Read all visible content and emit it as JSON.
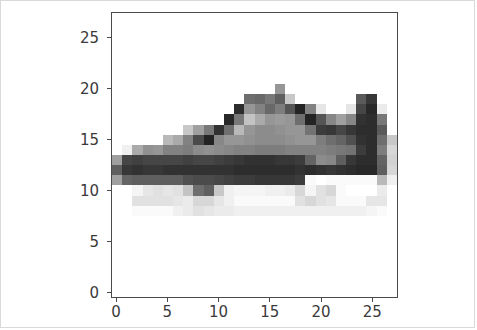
{
  "figure": {
    "background_color": "#ffffff",
    "border_color": "#d9d9d9",
    "axes_edge_color": "#4a4a4a",
    "tick_label_color": "#3a3a3a"
  },
  "chart_data": {
    "type": "heatmap",
    "title": "",
    "xlabel": "",
    "ylabel": "",
    "colormap": "gray",
    "origin": "upper",
    "grid": false,
    "legend": null,
    "colorbar": false,
    "vmin": 0,
    "vmax": 255,
    "shape": [
      28,
      28
    ],
    "xlim": [
      -0.5,
      27.5
    ],
    "ylim": [
      27.5,
      -0.5
    ],
    "xticks": [
      0,
      5,
      10,
      15,
      20,
      25
    ],
    "xticklabels": [
      "0",
      "5",
      "10",
      "15",
      "20",
      "25"
    ],
    "yticks": [
      0,
      5,
      10,
      15,
      20,
      25
    ],
    "yticklabels": [
      "0",
      "5",
      "10",
      "15",
      "20",
      "25"
    ],
    "values": [
      [
        255,
        255,
        255,
        255,
        255,
        255,
        255,
        255,
        255,
        255,
        255,
        255,
        255,
        255,
        255,
        255,
        255,
        255,
        255,
        255,
        255,
        255,
        255,
        255,
        255,
        255,
        255,
        255
      ],
      [
        255,
        255,
        255,
        255,
        255,
        255,
        255,
        255,
        255,
        255,
        255,
        255,
        255,
        255,
        255,
        255,
        255,
        255,
        255,
        255,
        255,
        255,
        255,
        255,
        255,
        255,
        255,
        255
      ],
      [
        255,
        255,
        255,
        255,
        255,
        255,
        255,
        255,
        255,
        255,
        255,
        255,
        255,
        255,
        255,
        255,
        255,
        255,
        255,
        255,
        255,
        255,
        255,
        255,
        255,
        255,
        255,
        255
      ],
      [
        255,
        255,
        255,
        255,
        255,
        255,
        255,
        255,
        255,
        255,
        255,
        255,
        255,
        255,
        255,
        255,
        255,
        255,
        255,
        255,
        255,
        255,
        255,
        255,
        255,
        255,
        255,
        255
      ],
      [
        255,
        255,
        255,
        255,
        255,
        255,
        255,
        255,
        255,
        255,
        255,
        255,
        255,
        255,
        255,
        255,
        255,
        255,
        255,
        255,
        255,
        255,
        255,
        255,
        255,
        255,
        255,
        255
      ],
      [
        255,
        255,
        255,
        255,
        255,
        255,
        255,
        255,
        255,
        255,
        255,
        255,
        255,
        255,
        255,
        255,
        255,
        255,
        255,
        255,
        255,
        255,
        255,
        255,
        255,
        255,
        255,
        255
      ],
      [
        255,
        255,
        255,
        255,
        255,
        255,
        255,
        255,
        255,
        255,
        255,
        255,
        255,
        255,
        255,
        255,
        255,
        255,
        255,
        255,
        255,
        255,
        255,
        255,
        255,
        255,
        255,
        255
      ],
      [
        255,
        255,
        255,
        255,
        255,
        255,
        255,
        255,
        255,
        255,
        255,
        255,
        255,
        255,
        255,
        255,
        150,
        255,
        255,
        255,
        255,
        255,
        255,
        255,
        255,
        255,
        255,
        255
      ],
      [
        255,
        255,
        255,
        255,
        255,
        255,
        255,
        255,
        255,
        255,
        255,
        255,
        255,
        110,
        105,
        120,
        95,
        200,
        255,
        255,
        255,
        255,
        255,
        255,
        90,
        55,
        255,
        255
      ],
      [
        255,
        255,
        255,
        255,
        255,
        255,
        255,
        255,
        255,
        255,
        255,
        255,
        45,
        150,
        130,
        105,
        125,
        85,
        35,
        130,
        230,
        255,
        255,
        230,
        70,
        40,
        235,
        255
      ],
      [
        255,
        255,
        255,
        255,
        255,
        255,
        255,
        255,
        255,
        255,
        255,
        40,
        120,
        195,
        170,
        150,
        155,
        150,
        110,
        35,
        85,
        135,
        160,
        135,
        50,
        45,
        120,
        255
      ],
      [
        255,
        255,
        255,
        255,
        255,
        255,
        255,
        200,
        160,
        120,
        50,
        110,
        185,
        150,
        140,
        140,
        145,
        150,
        150,
        115,
        60,
        55,
        70,
        55,
        45,
        45,
        90,
        255
      ],
      [
        255,
        255,
        255,
        255,
        255,
        185,
        170,
        130,
        75,
        35,
        135,
        150,
        150,
        145,
        140,
        140,
        140,
        145,
        150,
        150,
        125,
        110,
        100,
        80,
        50,
        45,
        110,
        200
      ],
      [
        255,
        240,
        170,
        145,
        150,
        130,
        130,
        125,
        140,
        145,
        140,
        135,
        130,
        130,
        125,
        125,
        125,
        130,
        130,
        130,
        130,
        125,
        120,
        115,
        60,
        45,
        125,
        215
      ],
      [
        160,
        70,
        65,
        70,
        70,
        70,
        70,
        65,
        70,
        70,
        65,
        60,
        55,
        50,
        50,
        50,
        55,
        55,
        60,
        100,
        140,
        135,
        95,
        55,
        45,
        45,
        100,
        210
      ],
      [
        95,
        55,
        50,
        55,
        55,
        50,
        50,
        50,
        50,
        50,
        50,
        50,
        45,
        45,
        45,
        45,
        45,
        45,
        50,
        45,
        50,
        55,
        50,
        45,
        40,
        40,
        95,
        215
      ],
      [
        160,
        100,
        95,
        95,
        95,
        95,
        95,
        80,
        75,
        75,
        70,
        65,
        60,
        60,
        55,
        55,
        55,
        55,
        60,
        250,
        255,
        250,
        250,
        250,
        250,
        250,
        185,
        240
      ],
      [
        255,
        255,
        245,
        230,
        225,
        230,
        225,
        195,
        110,
        95,
        200,
        240,
        245,
        245,
        245,
        240,
        240,
        235,
        215,
        245,
        225,
        215,
        250,
        255,
        255,
        255,
        235,
        255
      ],
      [
        255,
        255,
        225,
        225,
        225,
        225,
        230,
        235,
        215,
        215,
        230,
        240,
        250,
        250,
        250,
        250,
        250,
        250,
        225,
        215,
        225,
        230,
        250,
        250,
        250,
        230,
        230,
        255
      ],
      [
        255,
        255,
        250,
        250,
        250,
        250,
        240,
        235,
        225,
        230,
        235,
        235,
        240,
        240,
        240,
        240,
        240,
        240,
        240,
        240,
        240,
        240,
        240,
        240,
        240,
        245,
        250,
        255
      ],
      [
        255,
        255,
        255,
        255,
        255,
        255,
        255,
        255,
        255,
        255,
        255,
        255,
        255,
        255,
        255,
        255,
        255,
        255,
        255,
        255,
        255,
        255,
        255,
        255,
        255,
        255,
        255,
        255
      ],
      [
        255,
        255,
        255,
        255,
        255,
        255,
        255,
        255,
        255,
        255,
        255,
        255,
        255,
        255,
        255,
        255,
        255,
        255,
        255,
        255,
        255,
        255,
        255,
        255,
        255,
        255,
        255,
        255
      ],
      [
        255,
        255,
        255,
        255,
        255,
        255,
        255,
        255,
        255,
        255,
        255,
        255,
        255,
        255,
        255,
        255,
        255,
        255,
        255,
        255,
        255,
        255,
        255,
        255,
        255,
        255,
        255,
        255
      ],
      [
        255,
        255,
        255,
        255,
        255,
        255,
        255,
        255,
        255,
        255,
        255,
        255,
        255,
        255,
        255,
        255,
        255,
        255,
        255,
        255,
        255,
        255,
        255,
        255,
        255,
        255,
        255,
        255
      ],
      [
        255,
        255,
        255,
        255,
        255,
        255,
        255,
        255,
        255,
        255,
        255,
        255,
        255,
        255,
        255,
        255,
        255,
        255,
        255,
        255,
        255,
        255,
        255,
        255,
        255,
        255,
        255,
        255
      ],
      [
        255,
        255,
        255,
        255,
        255,
        255,
        255,
        255,
        255,
        255,
        255,
        255,
        255,
        255,
        255,
        255,
        255,
        255,
        255,
        255,
        255,
        255,
        255,
        255,
        255,
        255,
        255,
        255
      ],
      [
        255,
        255,
        255,
        255,
        255,
        255,
        255,
        255,
        255,
        255,
        255,
        255,
        255,
        255,
        255,
        255,
        255,
        255,
        255,
        255,
        255,
        255,
        255,
        255,
        255,
        255,
        255,
        255
      ],
      [
        255,
        255,
        255,
        255,
        255,
        255,
        255,
        255,
        255,
        255,
        255,
        255,
        255,
        255,
        255,
        255,
        255,
        255,
        255,
        255,
        255,
        255,
        255,
        255,
        255,
        255,
        255,
        255
      ]
    ]
  }
}
